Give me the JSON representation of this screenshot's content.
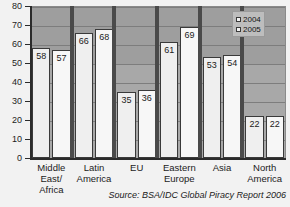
{
  "chart_data": {
    "type": "bar",
    "title": "",
    "subtitle": "",
    "xlabel": "",
    "ylabel": "",
    "ylim": [
      0,
      80
    ],
    "ytick_labels": [
      "80",
      "70",
      "60",
      "50",
      "40",
      "30",
      "20",
      "10",
      "0"
    ],
    "ytick_values": [
      80,
      70,
      60,
      50,
      40,
      30,
      20,
      10,
      0
    ],
    "grid": true,
    "legend_position": "top-right",
    "categories": [
      "Middle East/ Africa",
      "Latin America",
      "EU",
      "Eastern Europe",
      "Asia",
      "North America"
    ],
    "category_lines": [
      [
        "Middle",
        "East/",
        "Africa"
      ],
      [
        "Latin",
        "America"
      ],
      [
        "EU"
      ],
      [
        "Eastern",
        "Europe"
      ],
      [
        "Asia"
      ],
      [
        "North",
        "America"
      ]
    ],
    "series": [
      {
        "name": "2004",
        "values": [
          58,
          66,
          35,
          61,
          53,
          22
        ]
      },
      {
        "name": "2005",
        "values": [
          57,
          68,
          36,
          69,
          54,
          22
        ]
      }
    ],
    "annotations": {
      "source": "Source: BSA/IDC Global Piracy Report 2006"
    },
    "colors": {
      "plot_background": "#9e9e9e",
      "bar_2004": "#efefef",
      "bar_2005": "#f7f7f7",
      "bar_outline": "#3a3a3a",
      "axis": "#2b2b2b",
      "gridline": "#7d7d7d",
      "text": "#1b1b1b"
    }
  },
  "legend": {
    "items": [
      {
        "label": "2004"
      },
      {
        "label": "2005"
      }
    ]
  },
  "source": {
    "text": "Source: BSA/IDC Global Piracy Report 2006"
  }
}
